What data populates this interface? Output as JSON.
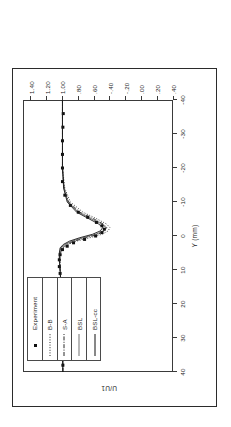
{
  "figure": {
    "caption_present": false
  },
  "chart_data": {
    "type": "line",
    "title": "",
    "subtitle": "",
    "orientation": "rotated-90-ccw",
    "xlabel": "Y (mm)",
    "ylabel": "U/U1",
    "grid": false,
    "legend_position": "upper-left-inside",
    "xlim": [
      40,
      -40
    ],
    "ylim": [
      -0.4,
      1.5
    ],
    "xticks": [
      "40",
      "30",
      "20",
      "10",
      "0",
      "-10",
      "-20",
      "-30",
      "-40"
    ],
    "xtick_values": [
      40,
      30,
      20,
      10,
      0,
      -10,
      -20,
      -30,
      -40
    ],
    "yticks": [
      ".40",
      ".20",
      ".00",
      "-.20",
      "-.40",
      ".60",
      ".80",
      "1.00",
      "1.20",
      "1.40"
    ],
    "ytick_values": [
      -0.4,
      -0.2,
      0.0,
      0.2,
      0.4,
      0.6,
      0.8,
      1.0,
      1.2,
      1.4
    ],
    "legend": [
      {
        "name": "Experiment",
        "style": "marker",
        "symbol": "filled-square",
        "color": "#101010"
      },
      {
        "name": "B-B",
        "style": "dotted",
        "color": "#101010"
      },
      {
        "name": "S-A",
        "style": "dash-dot",
        "color": "#101010"
      },
      {
        "name": "BSL",
        "style": "thin-solid",
        "color": "#101010"
      },
      {
        "name": "BSL-cc",
        "style": "solid",
        "color": "#101010"
      }
    ],
    "series": [
      {
        "name": "Experiment",
        "style": "marker",
        "x": [
          38,
          34,
          30,
          26,
          22,
          18,
          14,
          11,
          9,
          7,
          5.5,
          4,
          3,
          2,
          1,
          0,
          -1,
          -2,
          -3,
          -4,
          -5.5,
          -7,
          -9,
          -12,
          -16,
          -20,
          -24,
          -28,
          -32,
          -36
        ],
        "y": [
          0.995,
          1.0,
          1.0,
          1.005,
          1.01,
          1.015,
          1.02,
          1.03,
          1.04,
          1.04,
          1.03,
          1.0,
          0.94,
          0.86,
          0.72,
          0.58,
          0.5,
          0.47,
          0.5,
          0.57,
          0.68,
          0.8,
          0.9,
          0.97,
          1.0,
          1.0,
          1.0,
          1.0,
          0.995,
          0.99
        ]
      },
      {
        "name": "B-B",
        "style": "dotted",
        "x": [
          40,
          30,
          20,
          14,
          10,
          7,
          5,
          3.5,
          2.5,
          1.5,
          0.5,
          -0.5,
          -1.5,
          -2.5,
          -3.5,
          -5,
          -7,
          -10,
          -14,
          -20,
          -30,
          -40
        ],
        "y": [
          0.995,
          1.0,
          1.01,
          1.02,
          1.03,
          1.03,
          1.02,
          0.99,
          0.93,
          0.82,
          0.65,
          0.5,
          0.42,
          0.4,
          0.44,
          0.56,
          0.74,
          0.9,
          0.97,
          1.0,
          1.0,
          1.0
        ]
      },
      {
        "name": "S-A",
        "style": "dash-dot",
        "x": [
          40,
          30,
          20,
          14,
          10,
          7,
          5,
          3.5,
          2.5,
          1.5,
          0.5,
          -0.5,
          -1.5,
          -2.5,
          -3.5,
          -5,
          -7,
          -10,
          -14,
          -20,
          -30,
          -40
        ],
        "y": [
          0.995,
          1.0,
          1.01,
          1.02,
          1.03,
          1.035,
          1.03,
          1.0,
          0.95,
          0.85,
          0.7,
          0.55,
          0.47,
          0.44,
          0.48,
          0.6,
          0.78,
          0.92,
          0.98,
          1.0,
          1.0,
          1.0
        ]
      },
      {
        "name": "BSL",
        "style": "thin-solid",
        "x": [
          40,
          30,
          20,
          14,
          10,
          7,
          5,
          3.5,
          2.5,
          1.5,
          0.5,
          -0.5,
          -1.5,
          -2.5,
          -3.5,
          -5,
          -7,
          -10,
          -14,
          -20,
          -30,
          -40
        ],
        "y": [
          0.995,
          1.0,
          1.01,
          1.02,
          1.03,
          1.04,
          1.035,
          1.02,
          0.97,
          0.88,
          0.74,
          0.58,
          0.48,
          0.45,
          0.5,
          0.63,
          0.8,
          0.93,
          0.98,
          1.0,
          1.0,
          1.0
        ]
      },
      {
        "name": "BSL-cc",
        "style": "solid",
        "x": [
          40,
          30,
          20,
          14,
          10,
          7,
          5,
          3.5,
          2.5,
          1.5,
          0.5,
          -0.5,
          -1.5,
          -2.5,
          -3.5,
          -5,
          -7,
          -10,
          -14,
          -20,
          -30,
          -40
        ],
        "y": [
          0.995,
          1.0,
          1.01,
          1.02,
          1.03,
          1.04,
          1.04,
          1.03,
          0.99,
          0.91,
          0.78,
          0.62,
          0.52,
          0.49,
          0.54,
          0.66,
          0.82,
          0.94,
          0.985,
          1.0,
          1.0,
          1.0
        ]
      }
    ]
  }
}
